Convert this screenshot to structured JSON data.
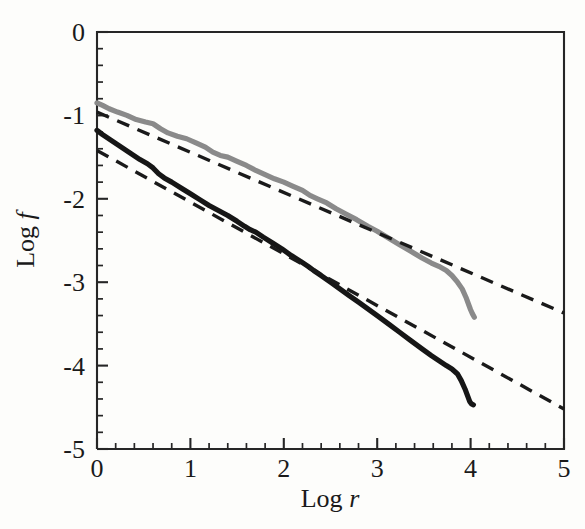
{
  "chart_data": {
    "type": "line",
    "title": "",
    "subtitle": "",
    "xlabel": "Log r",
    "xlabel_plain": "Log",
    "xlabel_italic": "r",
    "ylabel": "Log f",
    "ylabel_plain": "Log",
    "ylabel_italic": "f",
    "xlim": [
      0,
      5
    ],
    "ylim": [
      -5,
      0
    ],
    "xticks": [
      0,
      1,
      2,
      3,
      4,
      5
    ],
    "yticks": [
      0,
      -1,
      -2,
      -3,
      -4,
      -5
    ],
    "xtick_labels": [
      "0",
      "1",
      "2",
      "3",
      "4",
      "5"
    ],
    "ytick_labels": [
      "0",
      "-1",
      "-2",
      "-3",
      "-4",
      "-5"
    ],
    "x_minor_per_interval": 5,
    "y_minor_per_interval": 5,
    "grid": false,
    "legend": "none",
    "colors": {
      "upper_curve": "#8a8a8a",
      "lower_curve": "#161616",
      "fit_line": "#1a1a1a",
      "frame": "#262626",
      "background": "#fdfdfb"
    },
    "series": [
      {
        "name": "upper-measured-curve",
        "style": "solid",
        "color": "#8a8a8a",
        "x": [
          0.0,
          0.06,
          0.13,
          0.22,
          0.32,
          0.42,
          0.52,
          0.6,
          0.68,
          0.76,
          0.86,
          0.96,
          1.06,
          1.16,
          1.24,
          1.32,
          1.4,
          1.5,
          1.6,
          1.7,
          1.8,
          1.9,
          2.0,
          2.1,
          2.2,
          2.28,
          2.36,
          2.46,
          2.56,
          2.66,
          2.78,
          2.9,
          3.0,
          3.12,
          3.24,
          3.36,
          3.48,
          3.58,
          3.66,
          3.74,
          3.8,
          3.86,
          3.91,
          3.95,
          3.98,
          4.0,
          4.02,
          4.04
        ],
        "y": [
          -0.85,
          -0.88,
          -0.92,
          -0.96,
          -1.0,
          -1.05,
          -1.08,
          -1.1,
          -1.16,
          -1.21,
          -1.25,
          -1.28,
          -1.33,
          -1.38,
          -1.44,
          -1.48,
          -1.5,
          -1.55,
          -1.6,
          -1.66,
          -1.71,
          -1.76,
          -1.8,
          -1.85,
          -1.9,
          -1.96,
          -2.0,
          -2.05,
          -2.12,
          -2.18,
          -2.25,
          -2.33,
          -2.39,
          -2.47,
          -2.55,
          -2.63,
          -2.71,
          -2.77,
          -2.81,
          -2.86,
          -2.92,
          -3.0,
          -3.08,
          -3.18,
          -3.27,
          -3.33,
          -3.38,
          -3.42
        ]
      },
      {
        "name": "lower-measured-curve",
        "style": "solid",
        "color": "#161616",
        "x": [
          0.0,
          0.06,
          0.14,
          0.22,
          0.3,
          0.38,
          0.46,
          0.54,
          0.6,
          0.66,
          0.72,
          0.8,
          0.9,
          1.0,
          1.1,
          1.2,
          1.3,
          1.4,
          1.5,
          1.58,
          1.64,
          1.7,
          1.78,
          1.88,
          1.98,
          2.08,
          2.18,
          2.26,
          2.32,
          2.4,
          2.5,
          2.6,
          2.7,
          2.8,
          2.9,
          3.0,
          3.12,
          3.24,
          3.36,
          3.48,
          3.58,
          3.66,
          3.74,
          3.8,
          3.86,
          3.9,
          3.94,
          3.97,
          3.99,
          4.01,
          4.03
        ],
        "y": [
          -1.18,
          -1.23,
          -1.29,
          -1.35,
          -1.41,
          -1.47,
          -1.53,
          -1.58,
          -1.63,
          -1.7,
          -1.75,
          -1.8,
          -1.87,
          -1.94,
          -2.01,
          -2.08,
          -2.14,
          -2.2,
          -2.27,
          -2.33,
          -2.37,
          -2.4,
          -2.46,
          -2.53,
          -2.6,
          -2.68,
          -2.75,
          -2.81,
          -2.86,
          -2.92,
          -3.0,
          -3.08,
          -3.16,
          -3.24,
          -3.32,
          -3.4,
          -3.5,
          -3.6,
          -3.7,
          -3.8,
          -3.88,
          -3.94,
          -4.0,
          -4.04,
          -4.1,
          -4.18,
          -4.28,
          -4.37,
          -4.43,
          -4.46,
          -4.47
        ]
      },
      {
        "name": "upper-fit-line",
        "style": "dashed",
        "color": "#1a1a1a",
        "x": [
          0,
          5
        ],
        "y": [
          -0.96,
          -3.37
        ],
        "slope": -0.482,
        "intercept": -0.96
      },
      {
        "name": "lower-fit-line",
        "style": "dashed",
        "color": "#1a1a1a",
        "x": [
          0,
          5
        ],
        "y": [
          -1.42,
          -4.52
        ],
        "slope": -0.62,
        "intercept": -1.42
      }
    ],
    "annotations": []
  },
  "page": {
    "background_artifacts": "faint bleed-through text from reverse side of page"
  }
}
